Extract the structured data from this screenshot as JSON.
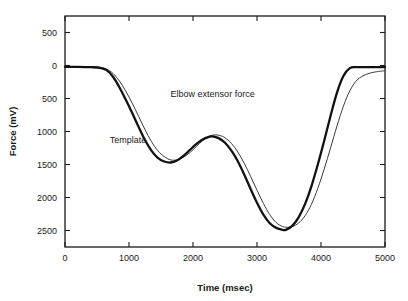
{
  "chart_data": {
    "type": "line",
    "title": "",
    "xlabel": "Time (msec)",
    "ylabel": "Force (mV)",
    "xlim": [
      0,
      5000
    ],
    "ylim": [
      -2750,
      750
    ],
    "xticks": [
      0,
      1000,
      2000,
      3000,
      4000,
      5000
    ],
    "xtick_labels": [
      "0",
      "1000",
      "2000",
      "3000",
      "4000",
      "5000"
    ],
    "yticks": [
      500,
      0,
      -500,
      -1000,
      -1500,
      -2000,
      -2500
    ],
    "ytick_labels": [
      "500",
      "0",
      "500",
      "1000",
      "1500",
      "2000",
      "2500"
    ],
    "grid": false,
    "legend_position": "inline-annotations",
    "ticks_all_sides": true,
    "annotations": [
      {
        "text": "Elbow extensor force",
        "x": 1650,
        "y": -480
      },
      {
        "text": "Template",
        "x": 700,
        "y": -1180
      }
    ],
    "series": [
      {
        "name": "Template",
        "style": "thick-black",
        "color": "#111111",
        "width": 2.3,
        "x": [
          0,
          200,
          400,
          550,
          650,
          750,
          850,
          950,
          1050,
          1150,
          1250,
          1350,
          1450,
          1550,
          1650,
          1750,
          1850,
          1950,
          2050,
          2150,
          2250,
          2300,
          2400,
          2500,
          2600,
          2700,
          2800,
          2900,
          3000,
          3100,
          3200,
          3300,
          3400,
          3450,
          3550,
          3650,
          3750,
          3850,
          3950,
          4050,
          4150,
          4250,
          4350,
          4450,
          4550,
          4700,
          4850,
          5000
        ],
        "y": [
          -20,
          -20,
          -25,
          -35,
          -70,
          -170,
          -330,
          -520,
          -720,
          -930,
          -1130,
          -1290,
          -1400,
          -1455,
          -1470,
          -1440,
          -1370,
          -1280,
          -1190,
          -1120,
          -1080,
          -1075,
          -1100,
          -1170,
          -1290,
          -1450,
          -1650,
          -1870,
          -2080,
          -2260,
          -2390,
          -2460,
          -2490,
          -2490,
          -2430,
          -2300,
          -2100,
          -1830,
          -1500,
          -1140,
          -760,
          -410,
          -160,
          -40,
          -25,
          -25,
          -25,
          -25
        ]
      },
      {
        "name": "Elbow extensor force",
        "style": "thin-gray",
        "color": "#3a3a3a",
        "width": 1.0,
        "x": [
          0,
          200,
          400,
          550,
          650,
          750,
          850,
          950,
          1050,
          1150,
          1250,
          1350,
          1450,
          1550,
          1650,
          1750,
          1850,
          1950,
          2050,
          2150,
          2250,
          2350,
          2450,
          2500,
          2600,
          2700,
          2800,
          2900,
          3000,
          3100,
          3200,
          3300,
          3400,
          3500,
          3600,
          3700,
          3800,
          3900,
          4000,
          4100,
          4200,
          4300,
          4400,
          4500,
          4600,
          4750,
          4900,
          5000
        ],
        "y": [
          -20,
          -20,
          -22,
          -30,
          -55,
          -120,
          -235,
          -390,
          -570,
          -770,
          -970,
          -1150,
          -1290,
          -1380,
          -1430,
          -1430,
          -1390,
          -1320,
          -1230,
          -1140,
          -1075,
          -1050,
          -1070,
          -1095,
          -1180,
          -1310,
          -1480,
          -1680,
          -1890,
          -2090,
          -2260,
          -2380,
          -2440,
          -2450,
          -2420,
          -2340,
          -2200,
          -1990,
          -1720,
          -1410,
          -1080,
          -760,
          -490,
          -300,
          -190,
          -120,
          -90,
          -80
        ]
      }
    ]
  }
}
